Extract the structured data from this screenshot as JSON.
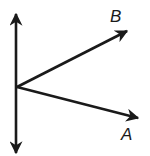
{
  "diagram": {
    "type": "geometry-angle",
    "stroke_color": "#1a1a1a",
    "background": "#ffffff",
    "vertex": {
      "x": 17,
      "y": 87
    },
    "line": {
      "name": "vertical-line",
      "top": {
        "x": 16,
        "y": 12
      },
      "bottom": {
        "x": 16,
        "y": 155
      },
      "arrows": "both"
    },
    "rays": [
      {
        "name": "ray-B",
        "label": "B",
        "end": {
          "x": 128,
          "y": 30
        },
        "label_pos": {
          "x": 110,
          "y": 22
        }
      },
      {
        "name": "ray-A",
        "label": "A",
        "end": {
          "x": 140,
          "y": 119
        },
        "label_pos": {
          "x": 121,
          "y": 140
        }
      }
    ]
  }
}
